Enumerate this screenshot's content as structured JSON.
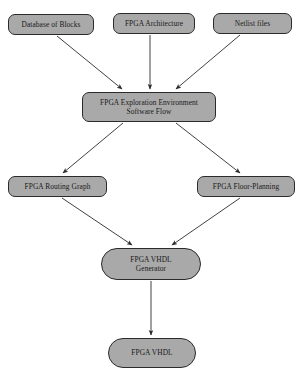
{
  "diagram": {
    "title": "FPGA Exploration Environment Software Flow",
    "type": "flowchart",
    "orientation": "top-to-bottom",
    "style": {
      "node_fill": "#a9a9a9",
      "node_border": "#2b2b2b",
      "edge_color": "#2b2b2b",
      "background": "#ffffff",
      "text_color": "#1a1a1a"
    },
    "nodes": [
      {
        "id": "database-of-blocks",
        "label": "Database of Blocks",
        "shape": "rounded-rectangle",
        "layer": "inputs",
        "x": 8,
        "y": 14,
        "w": 86,
        "h": 21
      },
      {
        "id": "fpga-architecture",
        "label": "FPGA Architecture",
        "shape": "rounded-rectangle",
        "layer": "inputs",
        "x": 113,
        "y": 13,
        "w": 82,
        "h": 21
      },
      {
        "id": "netlist-files",
        "label": "Netlist files",
        "shape": "rounded-rectangle",
        "layer": "inputs",
        "x": 213,
        "y": 13,
        "w": 79,
        "h": 21
      },
      {
        "id": "fpga-exploration-environment",
        "label": "FPGA Exploration Environment\nSoftware Flow",
        "shape": "rounded-rectangle",
        "layer": "core",
        "x": 82,
        "y": 92,
        "w": 134,
        "h": 30
      },
      {
        "id": "fpga-routing-graph",
        "label": "FPGA Routing Graph",
        "shape": "rounded-rectangle",
        "layer": "processing",
        "x": 8,
        "y": 176,
        "w": 99,
        "h": 21
      },
      {
        "id": "fpga-floor-planning",
        "label": "FPGA Floor-Planning",
        "shape": "rounded-rectangle",
        "layer": "processing",
        "x": 197,
        "y": 176,
        "w": 98,
        "h": 21
      },
      {
        "id": "fpga-vhdl-generator",
        "label": "FPGA VHDL\nGenerator",
        "shape": "rounded-rectangle",
        "layer": "generation",
        "x": 101,
        "y": 248,
        "w": 100,
        "h": 32
      },
      {
        "id": "fpga-vhdl",
        "label": "FPGA VHDL",
        "shape": "stadium",
        "layer": "output",
        "x": 108,
        "y": 338,
        "w": 88,
        "h": 30
      }
    ],
    "edges": [
      {
        "id": "edge-db-to-core",
        "from": "database-of-blocks",
        "to": "fpga-exploration-environment",
        "arrow": true
      },
      {
        "id": "edge-arch-to-core",
        "from": "fpga-architecture",
        "to": "fpga-exploration-environment",
        "arrow": true
      },
      {
        "id": "edge-netlist-to-core",
        "from": "netlist-files",
        "to": "fpga-exploration-environment",
        "arrow": true
      },
      {
        "id": "edge-core-to-routing",
        "from": "fpga-exploration-environment",
        "to": "fpga-routing-graph",
        "arrow": true
      },
      {
        "id": "edge-core-to-floorplan",
        "from": "fpga-exploration-environment",
        "to": "fpga-floor-planning",
        "arrow": true
      },
      {
        "id": "edge-routing-to-gen",
        "from": "fpga-routing-graph",
        "to": "fpga-vhdl-generator",
        "arrow": true
      },
      {
        "id": "edge-floorplan-to-gen",
        "from": "fpga-floor-planning",
        "to": "fpga-vhdl-generator",
        "arrow": true
      },
      {
        "id": "edge-gen-to-vhdl",
        "from": "fpga-vhdl-generator",
        "to": "fpga-vhdl",
        "arrow": true
      }
    ]
  }
}
